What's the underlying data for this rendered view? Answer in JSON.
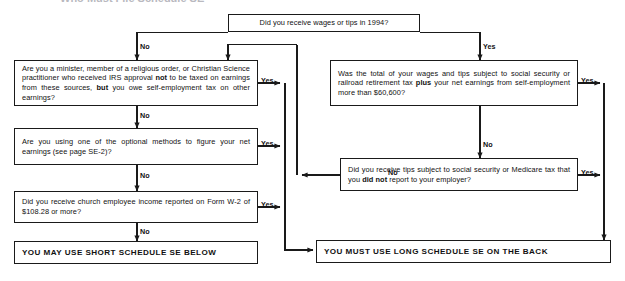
{
  "title_clipped": "Who Must File Schedule SE",
  "nodes": {
    "q_wages": {
      "label": "Did you receive wages or tips in 1994?",
      "kind": "decision"
    },
    "q_minister": {
      "label_parts": [
        {
          "t": "Are you a minister, member of a religious order, or Christian Science practitioner who received IRS approval ",
          "bold": false
        },
        {
          "t": "not",
          "bold": true
        },
        {
          "t": " to be taxed on earnings from these sources, ",
          "bold": false
        },
        {
          "t": "but",
          "bold": true
        },
        {
          "t": " you owe self-employment tax on other earnings?",
          "bold": false
        }
      ],
      "kind": "decision"
    },
    "q_optional": {
      "label_parts": [
        {
          "t": "Are you using one of the optional methods to figure your net earnings (see page SE-2)?",
          "bold": false
        }
      ],
      "kind": "decision"
    },
    "q_church": {
      "label_parts": [
        {
          "t": "Did you receive church employee income reported on Form W-2 of $108.28 or more?",
          "bold": false
        }
      ],
      "kind": "decision"
    },
    "q_total": {
      "label_parts": [
        {
          "t": "Was the total of your wages and tips subject to social security or railroad retirement tax ",
          "bold": false
        },
        {
          "t": "plus",
          "bold": true
        },
        {
          "t": " your net earnings from self-employment more than $60,600?",
          "bold": false
        }
      ],
      "kind": "decision"
    },
    "q_tips": {
      "label_parts": [
        {
          "t": "Did you receive tips subject to social security or Medicare tax that you ",
          "bold": false
        },
        {
          "t": "did not",
          "bold": true
        },
        {
          "t": " report to your employer?",
          "bold": false
        }
      ],
      "kind": "decision"
    },
    "r_short": {
      "label": "YOU MAY USE SHORT SCHEDULE SE BELOW",
      "kind": "result"
    },
    "r_long": {
      "label": "YOU MUST USE LONG SCHEDULE SE ON THE BACK",
      "kind": "result"
    }
  },
  "edge_labels": {
    "wages_no": "No",
    "wages_yes": "Yes",
    "minister_yes": "Yes",
    "minister_no": "No",
    "optional_yes": "Yes",
    "optional_no": "No",
    "church_yes": "Yes",
    "church_no": "No",
    "total_yes": "Yes",
    "total_no": "No",
    "tips_yes": "Yes",
    "tips_no": "No"
  },
  "colors": {
    "stroke": "#1a1a1a",
    "background": "#ffffff",
    "text": "#111111"
  }
}
